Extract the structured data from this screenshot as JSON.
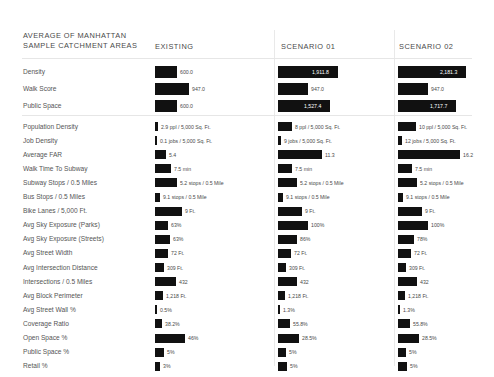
{
  "header": {
    "title": "AVERAGE OF MANHATTAN SAMPLE CATCHMENT AREAS",
    "columns": [
      "EXISTING",
      "SCENARIO 01",
      "SCENARIO 02"
    ]
  },
  "chart_data": {
    "type": "bar",
    "title": "AVERAGE OF MANHATTAN SAMPLE CATCHMENT AREAS",
    "xlabel": "",
    "ylabel": "",
    "grid": false,
    "legend": "none",
    "orientation": "horizontal",
    "series": [
      "EXISTING",
      "SCENARIO 01",
      "SCENARIO 02"
    ],
    "groups": [
      {
        "name": "summary",
        "rows": [
          {
            "category": "Density",
            "labels": [
              "600.0",
              "1,911.8",
              "2,181.3"
            ],
            "values": [
              600.0,
              1911.8,
              2181.3
            ],
            "widths": [
              22,
              60,
              68
            ],
            "inside": [
              false,
              true,
              true
            ]
          },
          {
            "category": "Walk Score",
            "labels": [
              "947.0",
              "947.0",
              "947.0"
            ],
            "values": [
              947.0,
              947.0,
              947.0
            ],
            "widths": [
              34,
              30,
              30
            ],
            "inside": [
              false,
              false,
              false
            ]
          },
          {
            "category": "Public Space",
            "labels": [
              "600.0",
              "1,527.4",
              "1,717.7"
            ],
            "values": [
              600.0,
              1527.4,
              1717.7
            ],
            "widths": [
              22,
              52,
              58
            ],
            "inside": [
              false,
              true,
              true
            ]
          }
        ]
      },
      {
        "name": "metrics",
        "rows": [
          {
            "category": "Population Density",
            "labels": [
              "2.9 ppl / 5,000 Sq. Ft.",
              "8 ppl / 5,000 Sq. Ft.",
              "10 ppl / 5,000 Sq. Ft."
            ],
            "values": [
              2.9,
              8,
              10
            ],
            "widths": [
              3,
              14,
              18
            ],
            "inside": [
              false,
              false,
              false
            ]
          },
          {
            "category": "Job Density",
            "labels": [
              "0.1 jobs / 5,000 Sq. Ft.",
              "9 jobs / 5,000 Sq. Ft.",
              "12 jobs / 5,000 Sq. Ft."
            ],
            "values": [
              0.1,
              9,
              12
            ],
            "widths": [
              2,
              3,
              4
            ],
            "inside": [
              false,
              false,
              false
            ]
          },
          {
            "category": "Average FAR",
            "labels": [
              "5.4",
              "11.3",
              "16.2"
            ],
            "values": [
              5.4,
              11.3,
              16.2
            ],
            "widths": [
              11,
              44,
              62
            ],
            "inside": [
              false,
              false,
              false
            ]
          },
          {
            "category": "Walk Time To Subway",
            "labels": [
              "7.5 min",
              "7.5 min",
              "7.5 min"
            ],
            "values": [
              7.5,
              7.5,
              7.5
            ],
            "widths": [
              16,
              14,
              14
            ],
            "inside": [
              false,
              false,
              false
            ]
          },
          {
            "category": "Subway Stops / 0.5 Miles",
            "labels": [
              "5.2 stops / 0.5 Mile",
              "5.2 stops / 0.5 Mile",
              "5.2 stops / 0.5 Mile"
            ],
            "values": [
              5.2,
              5.2,
              5.2
            ],
            "widths": [
              22,
              19,
              19
            ],
            "inside": [
              false,
              false,
              false
            ]
          },
          {
            "category": "Bus Stops / 0.5 Miles",
            "labels": [
              "9.1 stops / 0.5 Mile",
              "9.1 stops / 0.5 Mile",
              "9.1 stops / 0.5 Mile"
            ],
            "values": [
              9.1,
              9.1,
              9.1
            ],
            "widths": [
              5,
              5,
              5
            ],
            "inside": [
              false,
              false,
              false
            ]
          },
          {
            "category": "Bike Lanes / 5,000 Ft.",
            "labels": [
              "9 Ft.",
              "9 Ft.",
              "9 Ft."
            ],
            "values": [
              9,
              9,
              9
            ],
            "widths": [
              27,
              24,
              24
            ],
            "inside": [
              false,
              false,
              false
            ]
          },
          {
            "category": "Avg Sky Exposure (Parks)",
            "labels": [
              "63%",
              "100%",
              "100%"
            ],
            "values": [
              63,
              100,
              100
            ],
            "widths": [
              13,
              30,
              30
            ],
            "inside": [
              false,
              false,
              false
            ]
          },
          {
            "category": "Avg Sky Exposure (Streets)",
            "labels": [
              "63%",
              "86%",
              "78%"
            ],
            "values": [
              63,
              86,
              78
            ],
            "widths": [
              15,
              19,
              16
            ],
            "inside": [
              false,
              false,
              false
            ]
          },
          {
            "category": "Avg Street Width",
            "labels": [
              "72 Ft.",
              "72 Ft.",
              "72 Ft."
            ],
            "values": [
              72,
              72,
              72
            ],
            "widths": [
              13,
              13,
              13
            ],
            "inside": [
              false,
              false,
              false
            ]
          },
          {
            "category": "Avg Intersection Distance",
            "labels": [
              "309 Ft.",
              "309 Ft.",
              "309 Ft."
            ],
            "values": [
              309,
              309,
              309
            ],
            "widths": [
              9,
              8,
              8
            ],
            "inside": [
              false,
              false,
              false
            ]
          },
          {
            "category": "Intersections / 0.5 Miles",
            "labels": [
              "432",
              "432",
              "432"
            ],
            "values": [
              432,
              432,
              432
            ],
            "widths": [
              21,
              19,
              19
            ],
            "inside": [
              false,
              false,
              false
            ]
          },
          {
            "category": "Avg Block Perimeter",
            "labels": [
              "1,218 Ft.",
              "1,218 Ft.",
              "1,218 Ft."
            ],
            "values": [
              1218,
              1218,
              1218
            ],
            "widths": [
              8,
              7,
              7
            ],
            "inside": [
              false,
              false,
              false
            ]
          },
          {
            "category": "Avg Street Wall %",
            "labels": [
              "0.5%",
              "1.3%",
              "1.3%"
            ],
            "values": [
              0.5,
              1.3,
              1.3
            ],
            "widths": [
              2,
              2,
              2
            ],
            "inside": [
              false,
              false,
              false
            ]
          },
          {
            "category": "Coverage Ratio",
            "labels": [
              "38.2%",
              "55.8%",
              "55.8%"
            ],
            "values": [
              38.2,
              55.8,
              55.8
            ],
            "widths": [
              7,
              12,
              12
            ],
            "inside": [
              false,
              false,
              false
            ]
          },
          {
            "category": "Open Space %",
            "labels": [
              "46%",
              "28.5%",
              "28.5%"
            ],
            "values": [
              46,
              28.5,
              28.5
            ],
            "widths": [
              30,
              21,
              21
            ],
            "inside": [
              false,
              false,
              false
            ]
          },
          {
            "category": "Public Space %",
            "labels": [
              "5%",
              "5%",
              "5%"
            ],
            "values": [
              5,
              5,
              5
            ],
            "widths": [
              9,
              8,
              8
            ],
            "inside": [
              false,
              false,
              false
            ]
          },
          {
            "category": "Retail %",
            "labels": [
              "3%",
              "5%",
              "5%"
            ],
            "values": [
              3,
              5,
              5
            ],
            "widths": [
              5,
              9,
              9
            ],
            "inside": [
              false,
              false,
              false
            ]
          }
        ]
      }
    ]
  },
  "layout": {
    "col_x": [
      155,
      278,
      398
    ],
    "col_head_x": [
      155,
      281,
      399
    ],
    "group1_top": 66,
    "group1_step": 17,
    "group2_top": 122,
    "group2_step": 14.1,
    "bar_h1": 12,
    "bar_h2": 9
  }
}
